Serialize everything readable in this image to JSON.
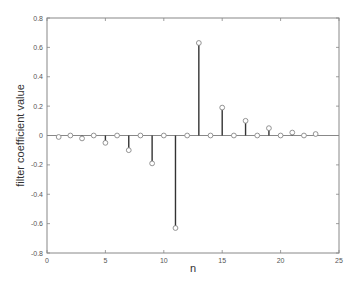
{
  "chart_data": {
    "type": "stem",
    "title": "",
    "xlabel": "n",
    "ylabel": "filter coefficient value",
    "xlim": [
      0,
      25
    ],
    "ylim": [
      -0.8,
      0.8
    ],
    "xticks": [
      0,
      5,
      10,
      15,
      20,
      25
    ],
    "xtick_labels": [
      "0",
      "5",
      "10",
      "15",
      "20",
      "25"
    ],
    "yticks": [
      0.8,
      0.6,
      0.4,
      0.2,
      0,
      -0.2,
      -0.4,
      -0.6,
      -0.8
    ],
    "ytick_labels": [
      "0.8",
      "0.6",
      "0.4",
      "0.2",
      "0",
      "-0.2",
      "-0.4",
      "-0.6",
      "-0.8"
    ],
    "grid": false,
    "legend": null,
    "x": [
      1,
      2,
      3,
      4,
      5,
      6,
      7,
      8,
      9,
      10,
      11,
      12,
      13,
      14,
      15,
      16,
      17,
      18,
      19,
      20,
      21,
      22,
      23
    ],
    "values": [
      -0.01,
      0.0,
      -0.02,
      0.0,
      -0.05,
      0.0,
      -0.1,
      0.0,
      -0.19,
      0.0,
      -0.63,
      0.0,
      0.63,
      0.0,
      0.19,
      0.0,
      0.1,
      0.0,
      0.05,
      0.0,
      0.02,
      0.0,
      0.01
    ],
    "marker": "circle",
    "colors": {
      "stem": "#333333",
      "marker": "#888888",
      "baseline": "#888888",
      "frame": "#888888"
    }
  }
}
